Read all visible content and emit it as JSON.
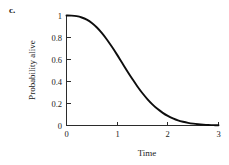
{
  "panel": {
    "label": "c."
  },
  "chart_data": {
    "type": "line",
    "title": "",
    "subtitle": "",
    "xlabel": "Time",
    "ylabel": "Probability alive",
    "xlim": [
      0,
      3
    ],
    "ylim": [
      0,
      1
    ],
    "grid": false,
    "legend": false,
    "legend_position": "none",
    "line_color": "#0d0d0d",
    "xticks": [
      "0",
      "1",
      "2",
      "3"
    ],
    "xtick_values": [
      0,
      1,
      2,
      3
    ],
    "yticks": [
      "0",
      "0.2",
      "0.4",
      "0.6",
      "0.8",
      "1"
    ],
    "ytick_values": [
      0,
      0.2,
      0.4,
      0.6,
      0.8,
      1
    ],
    "series": [
      {
        "name": "Probability alive",
        "x": [
          0,
          0.1,
          0.2,
          0.3,
          0.4,
          0.5,
          0.6,
          0.7,
          0.8,
          0.9,
          1.0,
          1.1,
          1.2,
          1.3,
          1.4,
          1.5,
          1.6,
          1.7,
          1.8,
          1.9,
          2.0,
          2.1,
          2.2,
          2.3,
          2.4,
          2.5,
          2.6,
          2.7,
          2.8,
          2.9,
          3.0
        ],
        "values": [
          1.0,
          0.999,
          0.994,
          0.982,
          0.962,
          0.932,
          0.891,
          0.84,
          0.78,
          0.713,
          0.642,
          0.568,
          0.494,
          0.423,
          0.355,
          0.293,
          0.238,
          0.19,
          0.149,
          0.115,
          0.087,
          0.065,
          0.047,
          0.034,
          0.024,
          0.017,
          0.012,
          0.008,
          0.005,
          0.003,
          0.002
        ]
      }
    ]
  }
}
